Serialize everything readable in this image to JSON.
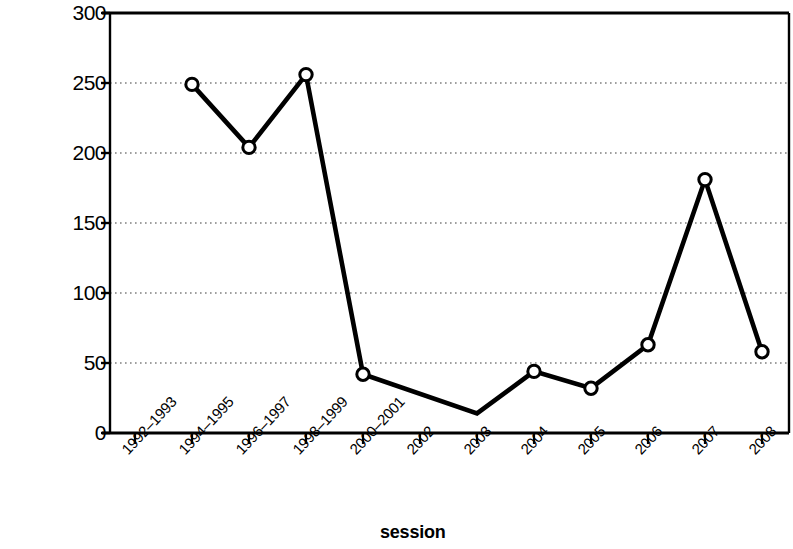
{
  "chart_data": {
    "type": "line",
    "title": "",
    "xlabel": "session",
    "ylabel": "proposed regulations reviewed",
    "categories": [
      "1992–1993",
      "1994–1995",
      "1996–1997",
      "1998–1999",
      "2000–2001",
      "2002",
      "2003",
      "2004",
      "2005",
      "2006",
      "2007",
      "2008"
    ],
    "values": [
      null,
      249,
      204,
      256,
      42,
      null,
      14,
      44,
      32,
      63,
      181,
      58
    ],
    "series": [
      {
        "name": "proposed regulations reviewed",
        "values": [
          null,
          249,
          204,
          256,
          42,
          null,
          14,
          44,
          32,
          63,
          181,
          58
        ]
      }
    ],
    "ylim": [
      0,
      300
    ],
    "yticks": [
      0,
      50,
      100,
      150,
      200,
      250,
      300
    ],
    "ytick_labels": [
      "0",
      "50",
      "100",
      "150",
      "200",
      "250",
      "300"
    ],
    "grid": "horizontal-dotted",
    "legend": "none",
    "marker": "open-circle",
    "line_color": "#000000",
    "marker_fill": "#ffffff",
    "grid_color": "#808080"
  }
}
